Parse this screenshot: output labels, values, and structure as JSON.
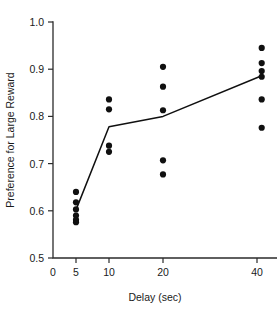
{
  "chart_data": {
    "type": "scatter",
    "title": "",
    "subtitle": "",
    "xlabel": "Delay (sec)",
    "ylabel": "Preference for Large Reward",
    "grid": false,
    "legend": null,
    "xlim": [
      0,
      45
    ],
    "ylim": [
      0.5,
      1.0
    ],
    "x_ticks": [
      0,
      5,
      10,
      20,
      40
    ],
    "x_tick_labels": [
      "0",
      "5",
      "10",
      "20",
      "40"
    ],
    "x_tick_pixels": [
      53,
      76,
      109,
      163,
      257
    ],
    "y_ticks": [
      0.5,
      0.6,
      0.7,
      0.8,
      0.9,
      1.0
    ],
    "y_tick_labels": [
      "0.5",
      "0.6",
      "0.7",
      "0.8",
      "0.9",
      "1.0"
    ],
    "x_scale_note": "irregular compressed spacing, approximately logarithmic above 5",
    "marker": "filled-circle",
    "marker_color": "#101010",
    "marker_radius_px": 3.1,
    "points": [
      {
        "x": 5,
        "y": 0.64
      },
      {
        "x": 5,
        "y": 0.618
      },
      {
        "x": 5,
        "y": 0.603
      },
      {
        "x": 5,
        "y": 0.59
      },
      {
        "x": 5,
        "y": 0.581
      },
      {
        "x": 5,
        "y": 0.576
      },
      {
        "x": 10,
        "y": 0.836
      },
      {
        "x": 10,
        "y": 0.815
      },
      {
        "x": 10,
        "y": 0.738
      },
      {
        "x": 10,
        "y": 0.725
      },
      {
        "x": 20,
        "y": 0.905
      },
      {
        "x": 20,
        "y": 0.863
      },
      {
        "x": 20,
        "y": 0.813
      },
      {
        "x": 20,
        "y": 0.707
      },
      {
        "x": 20,
        "y": 0.677
      },
      {
        "x": 41,
        "y": 0.945
      },
      {
        "x": 41,
        "y": 0.913
      },
      {
        "x": 41,
        "y": 0.896
      },
      {
        "x": 41,
        "y": 0.884
      },
      {
        "x": 41,
        "y": 0.836
      },
      {
        "x": 41,
        "y": 0.776
      }
    ],
    "series": [
      {
        "name": "mean preference",
        "type": "line",
        "color": "#101010",
        "x": [
          5,
          10,
          20,
          41
        ],
        "values": [
          0.602,
          0.778,
          0.8,
          0.886
        ]
      }
    ]
  }
}
